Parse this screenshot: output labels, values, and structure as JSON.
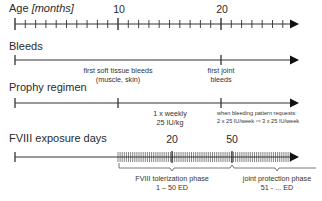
{
  "age_axis": {
    "title": "Age",
    "unit": "[months]",
    "major_labels": [
      {
        "value": "10",
        "x": 118
      },
      {
        "value": "20",
        "x": 221
      }
    ],
    "range_months": [
      0,
      27
    ]
  },
  "bleeds_axis": {
    "title": "Bleeds",
    "events": [
      {
        "line1": "first soft tissue bleeds",
        "line2": "(muscle, skin)",
        "x": 118
      },
      {
        "line1": "first joint",
        "line2": "bleeds",
        "x": 221
      }
    ]
  },
  "prophy_axis": {
    "title": "Prophy regimen",
    "events": [
      {
        "line1": "1 x weekly",
        "line2": "25 IU/kg",
        "x": 170
      },
      {
        "line1": "when bleeding pattern requests:",
        "line2": "2 x 25 IU/week ⇨ 3 x 25 IU/week",
        "x": 221
      }
    ]
  },
  "fviii_axis": {
    "title": "FVIII exposure days",
    "major_labels": [
      {
        "value": "20",
        "x": 172
      },
      {
        "value": "50",
        "x": 232
      }
    ],
    "phases": [
      {
        "name": "FVIII tolerization phase",
        "range": "1 – 50 ED"
      },
      {
        "name": "joint protection phase",
        "range": "51 - ... ED"
      }
    ]
  },
  "colors": {
    "line": "#333333",
    "text": "#2a2a2a"
  }
}
